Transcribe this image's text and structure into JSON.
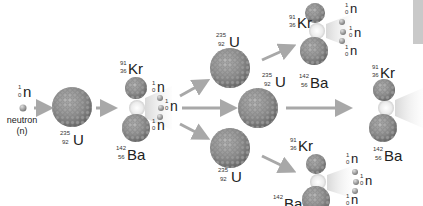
{
  "diagram": {
    "colors": {
      "arrow": "#a8a8a8",
      "nucleus": "#8a8a8a",
      "nucleus_highlight": "#c8c8c8",
      "neutron": "#9a9a9a",
      "flash": "#f2f2f2",
      "side_bar": "#c9c9c9"
    },
    "initial_neutron": {
      "symbol": "n",
      "mass": "1",
      "atomic": "0",
      "caption_line1": "neutron",
      "caption_line2": "(n)"
    },
    "uranium": {
      "symbol": "U",
      "mass": "235",
      "atomic": "92"
    },
    "krypton": {
      "symbol": "Kr",
      "mass": "91",
      "atomic": "36"
    },
    "barium": {
      "symbol": "Ba",
      "mass": "142",
      "atomic": "56"
    },
    "neutron": {
      "symbol": "n",
      "mass": "1",
      "atomic": "0"
    },
    "stages": [
      {
        "name": "neutron",
        "count": 1
      },
      {
        "name": "U-235",
        "count": 1
      },
      {
        "name": "fission products Kr-91 + Ba-142 + 3n",
        "count": 1
      },
      {
        "name": "U-235",
        "count": 3
      },
      {
        "name": "fission products Kr-91 + Ba-142 + 3n",
        "count": 3
      }
    ]
  }
}
